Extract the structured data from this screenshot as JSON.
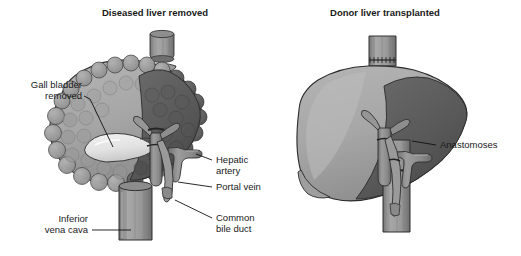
{
  "figure": {
    "type": "medical-illustration",
    "background_color": "#ffffff",
    "panel_count": 2
  },
  "palette": {
    "liver_light": "#a9a9a9",
    "liver_mid": "#9a9a9a",
    "liver_dark": "#5e5e5e",
    "liver_darker": "#4a4a4a",
    "cirrhotic_nodule": "#8f8f8f",
    "vessel": "#8c8c8c",
    "vessel_shadow": "#6b6b6b",
    "gallbladder": "#e6e6e6",
    "outline": "#2b2b2b",
    "text": "#1a1a1a",
    "ivc_cuff": "#9e9e9e"
  },
  "panels": [
    {
      "id": "left",
      "title": "Diseased liver removed",
      "labels": [
        {
          "id": "gall-bladder-removed",
          "text_lines": [
            "Gall bladder",
            "removed"
          ],
          "align": "right"
        },
        {
          "id": "inferior-vena-cava",
          "text_lines": [
            "Inferior",
            "vena cava"
          ],
          "align": "right"
        },
        {
          "id": "hepatic-artery",
          "text_lines": [
            "Hepatic",
            "artery"
          ],
          "align": "left"
        },
        {
          "id": "portal-vein",
          "text_lines": [
            "Portal vein"
          ],
          "align": "left"
        },
        {
          "id": "common-bile-duct",
          "text_lines": [
            "Common",
            "bile duct"
          ],
          "align": "left"
        }
      ],
      "structures": [
        "cirrhotic-liver-left-lobe",
        "liver-right-lobe-dark",
        "detached-ivc-cuff",
        "gallbladder-fossa",
        "portal-vein-stump",
        "hepatic-artery-stump",
        "common-bile-duct-stump",
        "inferior-vena-cava-trunk"
      ]
    },
    {
      "id": "right",
      "title": "Donor liver transplanted",
      "labels": [
        {
          "id": "anastomoses",
          "text_lines": [
            "Anastomoses"
          ],
          "align": "left"
        }
      ],
      "structures": [
        "donor-liver-smooth",
        "suprahepatic-ivc-anastomosis",
        "portal-vein-anastomosis",
        "hepatic-artery-anastomosis",
        "bile-duct-anastomosis",
        "inferior-vena-cava-trunk"
      ]
    }
  ]
}
